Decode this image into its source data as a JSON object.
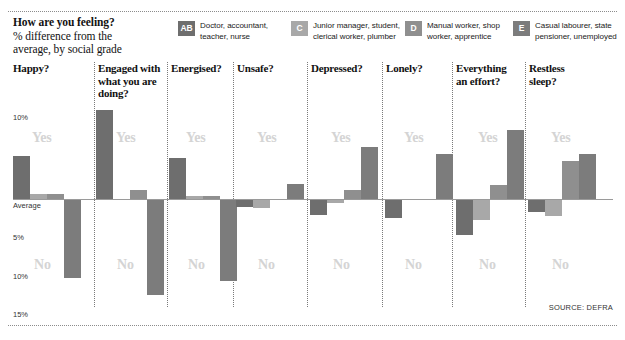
{
  "header": {
    "title": "How are you feeling?",
    "subtitle_line1": "% difference from the",
    "subtitle_line2": "average, by social grade"
  },
  "legend": {
    "items": [
      {
        "key": "AB",
        "line1": "Doctor, accountant,",
        "line2": "teacher, nurse",
        "color": "#6e6e6e"
      },
      {
        "key": "C",
        "line1": "Junior manager, student,",
        "line2": "clerical worker, plumber",
        "color": "#a8a8a8"
      },
      {
        "key": "D",
        "line1": "Manual worker, shop",
        "line2": "worker, apprentice",
        "color": "#8f8f8f"
      },
      {
        "key": "E",
        "line1": "Casual labourer, state",
        "line2": "pensioner, unemployed",
        "color": "#7c7c7c"
      }
    ]
  },
  "axis": {
    "labels": [
      "10%",
      "Average",
      "5%",
      "10%",
      "15%"
    ],
    "baseline_label": "Average",
    "watermark_yes": "Yes",
    "watermark_no": "No"
  },
  "source": "SOURCE: DEFRA",
  "chart_data": {
    "type": "bar",
    "title": "How are you feeling?",
    "subtitle": "% difference from the average, by social grade",
    "ylabel": "% difference from average",
    "xlabel": "",
    "ylim": [
      -17,
      12
    ],
    "yticks": [
      10,
      0,
      -5,
      -10,
      -15
    ],
    "ytick_labels": [
      "10%",
      "Average",
      "5%",
      "10%",
      "15%"
    ],
    "grid": false,
    "legend_position": "top",
    "categories": [
      "Happy?",
      "Engaged with what you are doing?",
      "Energised?",
      "Unsafe?",
      "Depressed?",
      "Lonely?",
      "Everything an effort?",
      "Restless sleep?"
    ],
    "series": [
      {
        "name": "AB",
        "label": "Doctor, accountant, teacher, nurse",
        "color": "#6e6e6e",
        "values": [
          5.0,
          10.3,
          4.8,
          -0.9,
          -1.9,
          -2.2,
          -4.2,
          -1.5
        ]
      },
      {
        "name": "C",
        "label": "Junior manager, student, clerical worker, plumber",
        "color": "#a8a8a8",
        "values": [
          0.6,
          0.0,
          0.3,
          -1.1,
          -0.5,
          0.0,
          -2.4,
          -2.0
        ]
      },
      {
        "name": "D",
        "label": "Manual worker, shop worker, apprentice",
        "color": "#8f8f8f",
        "values": [
          0.6,
          1.0,
          0.3,
          0.0,
          1.0,
          0.0,
          1.6,
          4.4
        ]
      },
      {
        "name": "E",
        "label": "Casual labourer, state pensioner, unemployed",
        "color": "#7c7c7c",
        "values": [
          -9.2,
          -11.2,
          -9.5,
          1.7,
          6.0,
          5.2,
          8.0,
          5.2
        ]
      }
    ],
    "source": "SOURCE: DEFRA"
  }
}
